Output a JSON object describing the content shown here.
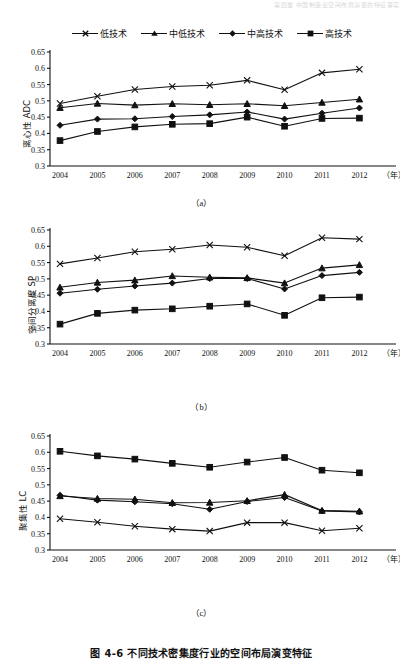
{
  "running_header": "第四章 中国制造业空间布局演变的特征事实",
  "legend": {
    "items": [
      {
        "label": "低技术",
        "marker": "x-marker",
        "color": "#111111"
      },
      {
        "label": "中低技术",
        "marker": "triangle-marker",
        "color": "#111111"
      },
      {
        "label": "中高技术",
        "marker": "diamond-marker",
        "color": "#111111"
      },
      {
        "label": "高技术",
        "marker": "square-marker",
        "color": "#111111"
      }
    ]
  },
  "figure_caption": "图 4-6  不同技术密集度行业的空间布局演变特征",
  "x_axis_unit": "（年）",
  "subcaptions": {
    "a": "（a）",
    "b": "（b）",
    "c": "（c）"
  },
  "chart_data": [
    {
      "type": "line",
      "title": "",
      "panel": "(a)",
      "xlabel": "年",
      "ylabel": "离心性 ADC",
      "grid": false,
      "legend_position": "top",
      "x": [
        2004,
        2005,
        2006,
        2007,
        2008,
        2009,
        2010,
        2011,
        2012
      ],
      "xticklabels": [
        "2004",
        "2005",
        "2006",
        "2007",
        "2008",
        "2009",
        "2010",
        "2011",
        "2012"
      ],
      "ylim": [
        0.3,
        0.65
      ],
      "yticks": [
        0.3,
        0.35,
        0.4,
        0.45,
        0.5,
        0.55,
        0.6,
        0.65
      ],
      "yticklabels": [
        "0.3",
        "0.35",
        "0.4",
        "0.45",
        "0.5",
        "0.55",
        "0.6",
        "0.65"
      ],
      "series": [
        {
          "name": "低技术",
          "marker": "x-marker",
          "values": [
            0.492,
            0.514,
            0.535,
            0.544,
            0.548,
            0.563,
            0.534,
            0.586,
            0.597
          ]
        },
        {
          "name": "中低技术",
          "marker": "triangle-marker",
          "values": [
            0.479,
            0.492,
            0.487,
            0.491,
            0.488,
            0.491,
            0.485,
            0.495,
            0.505
          ]
        },
        {
          "name": "中高技术",
          "marker": "diamond-marker",
          "values": [
            0.425,
            0.444,
            0.445,
            0.452,
            0.457,
            0.466,
            0.444,
            0.462,
            0.478
          ]
        },
        {
          "name": "高技术",
          "marker": "square-marker",
          "values": [
            0.378,
            0.406,
            0.42,
            0.428,
            0.43,
            0.45,
            0.422,
            0.446,
            0.447
          ]
        }
      ]
    },
    {
      "type": "line",
      "title": "",
      "panel": "(b)",
      "xlabel": "年",
      "ylabel": "空间分离度 SP",
      "grid": false,
      "legend_position": "top",
      "x": [
        2004,
        2005,
        2006,
        2007,
        2008,
        2009,
        2010,
        2011,
        2012
      ],
      "xticklabels": [
        "2004",
        "2005",
        "2006",
        "2007",
        "2008",
        "2009",
        "2010",
        "2011",
        "2012"
      ],
      "ylim": [
        0.3,
        0.65
      ],
      "yticks": [
        0.3,
        0.35,
        0.4,
        0.45,
        0.5,
        0.55,
        0.6,
        0.65
      ],
      "yticklabels": [
        "0.3",
        "0.35",
        "0.4",
        "0.45",
        "0.5",
        "0.55",
        "0.6",
        "0.65"
      ],
      "series": [
        {
          "name": "低技术",
          "marker": "x-marker",
          "values": [
            0.546,
            0.564,
            0.583,
            0.591,
            0.604,
            0.597,
            0.571,
            0.626,
            0.622
          ]
        },
        {
          "name": "中低技术",
          "marker": "triangle-marker",
          "values": [
            0.474,
            0.489,
            0.496,
            0.509,
            0.505,
            0.503,
            0.487,
            0.533,
            0.543
          ]
        },
        {
          "name": "中高技术",
          "marker": "diamond-marker",
          "values": [
            0.456,
            0.468,
            0.478,
            0.487,
            0.501,
            0.501,
            0.469,
            0.51,
            0.52
          ]
        },
        {
          "name": "高技术",
          "marker": "square-marker",
          "values": [
            0.361,
            0.394,
            0.404,
            0.408,
            0.416,
            0.423,
            0.388,
            0.442,
            0.444
          ]
        }
      ]
    },
    {
      "type": "line",
      "title": "",
      "panel": "(c)",
      "xlabel": "年",
      "ylabel": "聚集性 LC",
      "grid": false,
      "legend_position": "top",
      "x": [
        2004,
        2005,
        2006,
        2007,
        2008,
        2009,
        2010,
        2011,
        2012
      ],
      "xticklabels": [
        "2004",
        "2005",
        "2006",
        "2007",
        "2008",
        "2009",
        "2010",
        "2011",
        "2012"
      ],
      "ylim": [
        0.3,
        0.65
      ],
      "yticks": [
        0.3,
        0.35,
        0.4,
        0.45,
        0.5,
        0.55,
        0.6,
        0.65
      ],
      "yticklabels": [
        "0.3",
        "0.35",
        "0.4",
        "0.45",
        "0.5",
        "0.55",
        "0.6",
        "0.65"
      ],
      "series": [
        {
          "name": "低技术",
          "marker": "x-marker",
          "values": [
            0.396,
            0.385,
            0.373,
            0.364,
            0.358,
            0.384,
            0.384,
            0.359,
            0.367
          ]
        },
        {
          "name": "中低技术",
          "marker": "triangle-marker",
          "values": [
            0.466,
            0.458,
            0.456,
            0.445,
            0.446,
            0.451,
            0.47,
            0.421,
            0.419
          ]
        },
        {
          "name": "中高技术",
          "marker": "diamond-marker",
          "values": [
            0.468,
            0.453,
            0.448,
            0.442,
            0.425,
            0.449,
            0.461,
            0.42,
            0.417
          ]
        },
        {
          "name": "高技术",
          "marker": "square-marker",
          "values": [
            0.603,
            0.589,
            0.579,
            0.566,
            0.554,
            0.57,
            0.584,
            0.545,
            0.537
          ]
        }
      ]
    }
  ]
}
